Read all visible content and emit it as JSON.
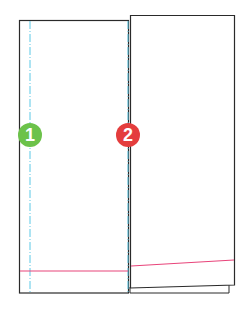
{
  "diagram": {
    "colors": {
      "outline": "#2a2a2a",
      "fold_line": "#5bc8e6",
      "hem_line": "#e8447a",
      "badge_1": "#6cc24a",
      "badge_2": "#e43d3d"
    },
    "badges": [
      {
        "label": "1",
        "color": "#6cc24a",
        "x": 30,
        "y": 135
      },
      {
        "label": "2",
        "color": "#e43d3d",
        "x": 128,
        "y": 135
      }
    ],
    "panels": {
      "left": {
        "x": 19,
        "y": 20,
        "width": 109,
        "height": 273
      },
      "right": {
        "x": 130,
        "y": 15,
        "width": 104,
        "height": 272
      }
    },
    "fold_lines": [
      {
        "id": 1,
        "x": 30,
        "y1": 20,
        "y2": 293
      },
      {
        "id": 2,
        "x": 128,
        "y1": 20,
        "y2": 293
      }
    ],
    "hem_lines": {
      "left": {
        "x1": 19,
        "y1": 271,
        "x2": 128,
        "y2": 271
      },
      "right": {
        "x1": 130,
        "y1": 266,
        "x2": 234,
        "y2": 260
      }
    }
  }
}
